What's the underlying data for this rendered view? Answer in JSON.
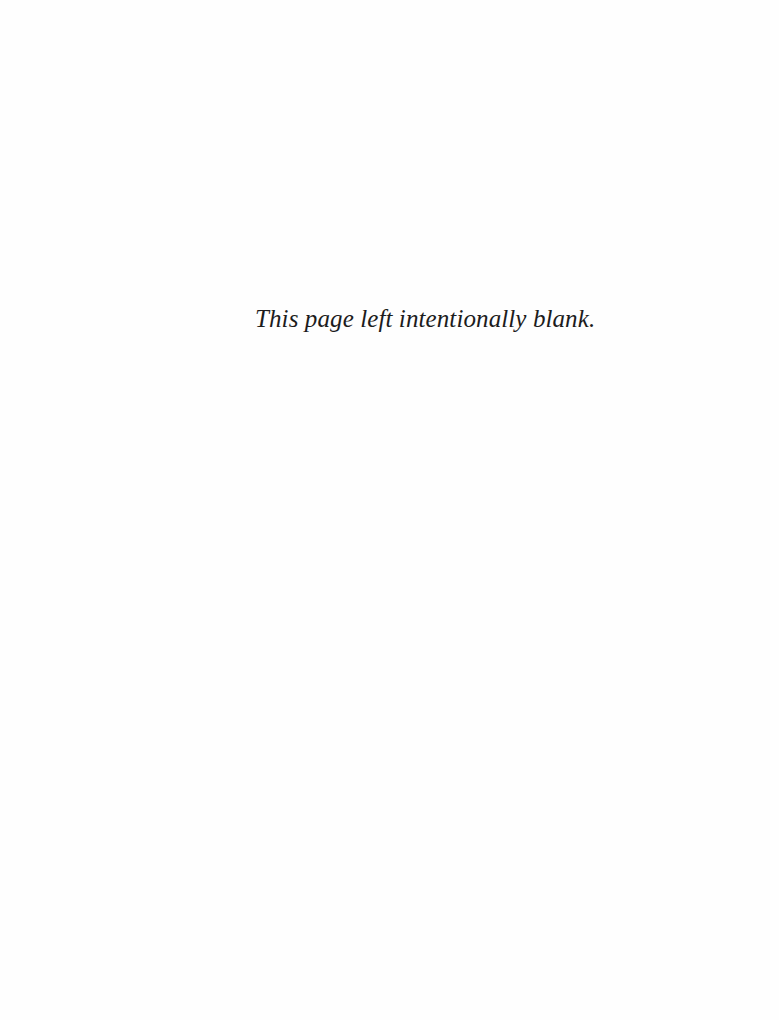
{
  "page": {
    "notice": "This page left intentionally blank."
  }
}
